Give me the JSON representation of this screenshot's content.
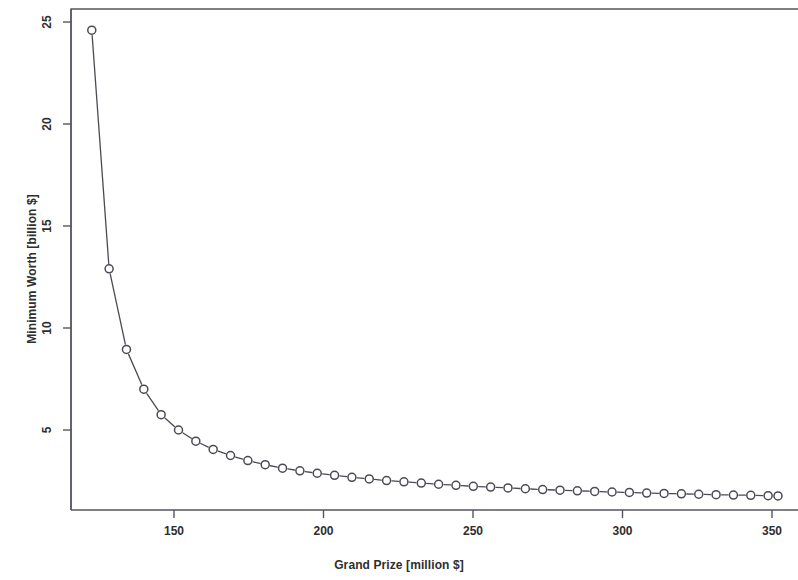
{
  "figure": {
    "background_color": "#ffffff",
    "foreground_color": "#4a4a52",
    "frame_color": "#55555d"
  },
  "chart_data": {
    "type": "line",
    "title": "",
    "subtitle": "",
    "xlabel": "Grand Prize [million $]",
    "ylabel": "Minimum Worth [billion $]",
    "xlim": [
      120,
      354
    ],
    "ylim": [
      1.2,
      26.0
    ],
    "xticks": [
      150,
      200,
      250,
      300,
      350
    ],
    "xtick_labels": [
      "150",
      "200",
      "250",
      "300",
      "350"
    ],
    "yticks": [
      5,
      10,
      15,
      20,
      25
    ],
    "ytick_labels": [
      "5",
      "10",
      "15",
      "20",
      "25"
    ],
    "grid": false,
    "legend": null,
    "marker": "open-circle",
    "line_style": "solid",
    "annotations": [],
    "series": [
      {
        "name": "Minimum Worth vs Grand Prize",
        "x": [
          122.5,
          128.3,
          134.1,
          139.9,
          145.7,
          151.5,
          157.3,
          163.1,
          168.9,
          174.7,
          180.5,
          186.3,
          192.1,
          197.9,
          203.7,
          209.5,
          215.3,
          221.1,
          226.9,
          232.7,
          238.5,
          244.3,
          250.1,
          255.9,
          261.7,
          267.5,
          273.3,
          279.1,
          284.9,
          290.7,
          296.5,
          302.3,
          308.1,
          313.9,
          319.7,
          325.5,
          331.3,
          337.1,
          342.9,
          348.7,
          352.0
        ],
        "y": [
          24.6,
          12.9,
          8.95,
          7.0,
          5.75,
          5.0,
          4.45,
          4.05,
          3.75,
          3.5,
          3.3,
          3.13,
          3.0,
          2.88,
          2.78,
          2.68,
          2.6,
          2.52,
          2.46,
          2.4,
          2.34,
          2.29,
          2.24,
          2.2,
          2.16,
          2.12,
          2.08,
          2.05,
          2.02,
          1.99,
          1.96,
          1.94,
          1.91,
          1.89,
          1.87,
          1.85,
          1.83,
          1.81,
          1.8,
          1.78,
          1.77
        ]
      }
    ]
  }
}
